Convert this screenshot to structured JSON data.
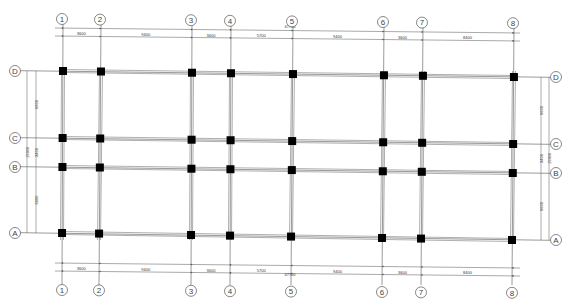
{
  "drawing": {
    "type": "structural column grid plan",
    "colors": {
      "line": "#555555",
      "beam": "#9a9a9a",
      "column": "#000000",
      "background": "#ffffff"
    }
  },
  "grid": {
    "x_axes": [
      {
        "label": "1",
        "top_x": 63,
        "bottom_x": 62
      },
      {
        "label": "2",
        "top_x": 101,
        "bottom_x": 99
      },
      {
        "label": "3",
        "top_x": 192,
        "bottom_x": 191
      },
      {
        "label": "4",
        "top_x": 231,
        "bottom_x": 230
      },
      {
        "label": "5",
        "top_x": 293,
        "bottom_x": 291
      },
      {
        "label": "6",
        "top_x": 384,
        "bottom_x": 382
      },
      {
        "label": "7",
        "top_x": 423,
        "bottom_x": 421
      },
      {
        "label": "8",
        "top_x": 514,
        "bottom_x": 512
      }
    ],
    "y_axes": [
      {
        "label": "D",
        "left_y": 71,
        "right_y": 77
      },
      {
        "label": "C",
        "left_y": 138,
        "right_y": 144
      },
      {
        "label": "B",
        "left_y": 167,
        "right_y": 173
      },
      {
        "label": "A",
        "left_y": 233,
        "right_y": 240
      }
    ]
  },
  "dimensions": {
    "top": {
      "total": "47700",
      "segments": [
        "3600",
        "9400",
        "3600",
        "5700",
        "9400",
        "3600",
        "8400"
      ]
    },
    "bottom": {
      "total": "47700",
      "segments": [
        "3600",
        "9400",
        "3600",
        "5700",
        "9400",
        "3600",
        "8400"
      ]
    },
    "left": {
      "total": "15900",
      "segments": [
        "6600",
        "2400",
        "6600"
      ]
    },
    "right": {
      "total": "15900",
      "segments": [
        "6600",
        "2400",
        "6600"
      ]
    }
  }
}
